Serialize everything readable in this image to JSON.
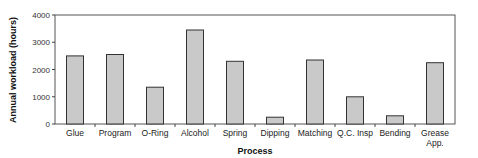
{
  "chart_data": {
    "type": "bar",
    "title": "",
    "xlabel": "Process",
    "ylabel": "Annual workload (hours)",
    "categories": [
      [
        "Glue"
      ],
      [
        "Program"
      ],
      [
        "O-Ring"
      ],
      [
        "Alcohol"
      ],
      [
        "Spring"
      ],
      [
        "Dipping"
      ],
      [
        "Matching"
      ],
      [
        "Q.C. Insp"
      ],
      [
        "Bending"
      ],
      [
        "Grease",
        "App."
      ]
    ],
    "category_names": [
      "Glue",
      "Program",
      "O-Ring",
      "Alcohol",
      "Spring",
      "Dipping",
      "Matching",
      "Q.C. Insp",
      "Bending",
      "Grease App."
    ],
    "values": [
      2500,
      2550,
      1350,
      3450,
      2300,
      250,
      2350,
      1000,
      300,
      2250
    ],
    "ylim": [
      0,
      4000
    ],
    "yticks": [
      0,
      1000,
      2000,
      3000,
      4000
    ],
    "grid": false,
    "legend": "none",
    "colors": {
      "bar_fill": "#c9c9c9",
      "bar_stroke": "#333333"
    }
  }
}
